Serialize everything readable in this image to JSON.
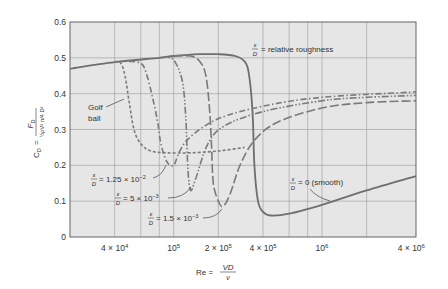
{
  "chart_data": {
    "type": "line",
    "title": "",
    "xlabel": "Re = VD/ν",
    "xlabel_parts": {
      "lhs": "Re =",
      "num": "VD",
      "den": "ν"
    },
    "ylabel": "C_D = F_D / (½ρV²(π/4)D²)",
    "ylabel_parts": {
      "lhs": "C",
      "lhs_sub": "D",
      "eq": "=",
      "num": "F",
      "num_sub": "D",
      "den": "½ρV² π/4 D²"
    },
    "xscale": "log",
    "xlim": [
      20000,
      4300000
    ],
    "ylim": [
      0,
      0.6
    ],
    "grid": true,
    "x_gridlines": [
      40000,
      60000,
      80000,
      100000,
      200000,
      400000,
      600000,
      800000,
      1000000,
      2000000
    ],
    "y_gridlines": [
      0.1,
      0.2,
      0.3,
      0.4,
      0.5
    ],
    "x_ticks": [
      {
        "value": 40000,
        "mant": "4 × 10",
        "exp": "4"
      },
      {
        "value": 100000,
        "mant": "10",
        "exp": "5"
      },
      {
        "value": 200000,
        "mant": "2 × 10",
        "exp": "5"
      },
      {
        "value": 400000,
        "mant": "4 × 10",
        "exp": "5"
      },
      {
        "value": 1000000,
        "mant": "10",
        "exp": "6"
      },
      {
        "value": 4000000,
        "mant": "4 × 10",
        "exp": "6"
      }
    ],
    "y_ticks": [
      {
        "value": 0,
        "label": "0"
      },
      {
        "value": 0.1,
        "label": "0.1"
      },
      {
        "value": 0.2,
        "label": "0.2"
      },
      {
        "value": 0.3,
        "label": "0.3"
      },
      {
        "value": 0.4,
        "label": "0.4"
      },
      {
        "value": 0.5,
        "label": "0.5"
      },
      {
        "value": 0.6,
        "label": "0.6"
      }
    ],
    "series": [
      {
        "name": "ε/D = 0 (smooth)",
        "style": "solid",
        "points": [
          [
            20000,
            0.47
          ],
          [
            40000,
            0.488
          ],
          [
            80000,
            0.5
          ],
          [
            100000,
            0.505
          ],
          [
            150000,
            0.51
          ],
          [
            200000,
            0.51
          ],
          [
            260000,
            0.505
          ],
          [
            300000,
            0.49
          ],
          [
            320000,
            0.46
          ],
          [
            340000,
            0.35
          ],
          [
            350000,
            0.2
          ],
          [
            370000,
            0.1
          ],
          [
            400000,
            0.07
          ],
          [
            450000,
            0.06
          ],
          [
            600000,
            0.065
          ],
          [
            1000000,
            0.09
          ],
          [
            2000000,
            0.13
          ],
          [
            4300000,
            0.17
          ]
        ]
      },
      {
        "name": "ε/D = 1.5 × 10⁻³",
        "style": "long-dash",
        "points": [
          [
            100000,
            0.505
          ],
          [
            130000,
            0.505
          ],
          [
            150000,
            0.49
          ],
          [
            165000,
            0.45
          ],
          [
            175000,
            0.35
          ],
          [
            180000,
            0.25
          ],
          [
            185000,
            0.15
          ],
          [
            200000,
            0.1
          ],
          [
            215000,
            0.085
          ],
          [
            240000,
            0.12
          ],
          [
            280000,
            0.2
          ],
          [
            350000,
            0.27
          ],
          [
            500000,
            0.32
          ],
          [
            1000000,
            0.36
          ],
          [
            2000000,
            0.375
          ],
          [
            4300000,
            0.38
          ]
        ]
      },
      {
        "name": "ε/D = 5 × 10⁻³",
        "style": "dash-dot-dot",
        "points": [
          [
            80000,
            0.5
          ],
          [
            95000,
            0.5
          ],
          [
            105000,
            0.48
          ],
          [
            115000,
            0.43
          ],
          [
            120000,
            0.35
          ],
          [
            123000,
            0.25
          ],
          [
            125000,
            0.18
          ],
          [
            130000,
            0.13
          ],
          [
            140000,
            0.16
          ],
          [
            170000,
            0.26
          ],
          [
            220000,
            0.31
          ],
          [
            400000,
            0.35
          ],
          [
            1000000,
            0.38
          ],
          [
            2000000,
            0.39
          ],
          [
            4300000,
            0.395
          ]
        ]
      },
      {
        "name": "ε/D = 1.25 × 10⁻²",
        "style": "dash-dot",
        "points": [
          [
            50000,
            0.49
          ],
          [
            60000,
            0.485
          ],
          [
            65000,
            0.46
          ],
          [
            72000,
            0.39
          ],
          [
            78000,
            0.32
          ],
          [
            82000,
            0.26
          ],
          [
            90000,
            0.21
          ],
          [
            100000,
            0.2
          ],
          [
            110000,
            0.24
          ],
          [
            130000,
            0.28
          ],
          [
            200000,
            0.33
          ],
          [
            400000,
            0.365
          ],
          [
            1000000,
            0.39
          ],
          [
            4300000,
            0.405
          ]
        ]
      },
      {
        "name": "Golf ball",
        "style": "short-dash",
        "points": [
          [
            40000,
            0.49
          ],
          [
            44000,
            0.485
          ],
          [
            47000,
            0.45
          ],
          [
            50000,
            0.38
          ],
          [
            54000,
            0.3
          ],
          [
            60000,
            0.26
          ],
          [
            70000,
            0.24
          ],
          [
            90000,
            0.235
          ],
          [
            130000,
            0.235
          ],
          [
            200000,
            0.24
          ],
          [
            300000,
            0.25
          ]
        ]
      }
    ],
    "annotations": [
      {
        "id": "relative-roughness",
        "frac_num": "ε",
        "frac_den": "D",
        "text": "= relative roughness"
      },
      {
        "id": "golf-ball",
        "text_line1": "Golf",
        "text_line2": "ball"
      },
      {
        "id": "e125",
        "frac_num": "ε",
        "frac_den": "D",
        "text": "= 1.25 × 10",
        "exp": "−2"
      },
      {
        "id": "e5",
        "frac_num": "ε",
        "frac_den": "D",
        "text": "= 5 × 10",
        "exp": "−3"
      },
      {
        "id": "e15",
        "frac_num": "ε",
        "frac_den": "D",
        "text": "= 1.5 × 10",
        "exp": "−3"
      },
      {
        "id": "smooth",
        "frac_num": "ε",
        "frac_den": "D",
        "text": "= 0 (smooth)"
      }
    ],
    "colors": {
      "plot_bg": "#e6e6e6",
      "grid": "#9a9a9a",
      "curve": "#7a7a7a",
      "smooth_curve": "#6e6e6e",
      "text": "#333333",
      "axis": "#555555"
    }
  }
}
